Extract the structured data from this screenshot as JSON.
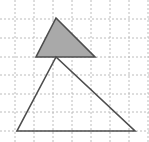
{
  "figure": {
    "canvas": {
      "width": 149,
      "height": 142,
      "background": "#ffffff"
    },
    "grid": {
      "line_color": "#b4b4b4",
      "line_width": 0.9,
      "dash_pattern": "2,2",
      "x_positions": [
        15,
        34,
        53,
        72,
        91,
        110,
        129,
        148
      ],
      "y_positions": [
        19,
        38,
        57,
        75,
        94,
        112,
        131
      ]
    },
    "shapes": [
      {
        "name": "shaded-triangle",
        "label": "Small shaded triangle",
        "fill": "#a9a9a9",
        "fill_opacity": 1,
        "stroke": "#4d4d4d",
        "stroke_width": 1.6,
        "points": "56,18 36,57 95,57",
        "vertices": [
          [
            56,
            18
          ],
          [
            36,
            57
          ],
          [
            95,
            57
          ]
        ]
      },
      {
        "name": "outline-triangle",
        "label": "Large unshaded triangle",
        "fill": "none",
        "fill_opacity": 0,
        "stroke": "#4d4d4d",
        "stroke_width": 1.6,
        "points": "56,57 17,131 135,131",
        "vertices": [
          [
            56,
            57
          ],
          [
            17,
            131
          ],
          [
            135,
            131
          ]
        ]
      }
    ]
  }
}
